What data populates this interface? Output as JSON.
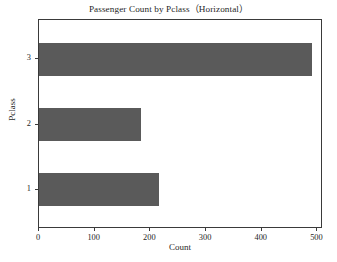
{
  "chart_data": {
    "type": "bar",
    "orientation": "horizontal",
    "title": "Passenger Count by Pclass（Horizontal）",
    "xlabel": "Count",
    "ylabel": "Pclass",
    "categories": [
      "1",
      "2",
      "3"
    ],
    "values": [
      216,
      184,
      491
    ],
    "series": [
      {
        "name": "Count",
        "values": [
          216,
          184,
          491
        ],
        "color": "#5a5a5a"
      }
    ],
    "xlim": [
      0,
      510
    ],
    "ylim": [
      0.4,
      3.6
    ],
    "xticks": [
      0,
      100,
      200,
      300,
      400,
      500
    ],
    "xtick_labels": [
      "0",
      "100",
      "200",
      "300",
      "400",
      "500"
    ],
    "yticks": [
      1,
      2,
      3
    ],
    "ytick_labels": [
      "1",
      "2",
      "3"
    ],
    "grid": false,
    "legend": false,
    "background_color": "#ffffff",
    "frame_color": "#3a3a3a"
  }
}
